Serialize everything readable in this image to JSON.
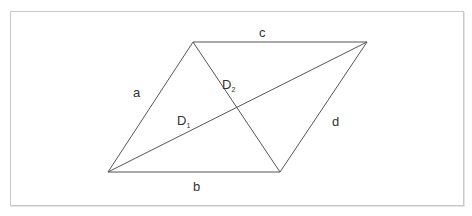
{
  "diagram": {
    "shape": "parallelogram",
    "vertices": {
      "bottom_left": [
        108,
        172
      ],
      "top_left": [
        193,
        42
      ],
      "top_right": [
        367,
        42
      ],
      "bottom_right": [
        280,
        172
      ]
    },
    "labels": {
      "a": "a",
      "b": "b",
      "c": "c",
      "d": "d",
      "D1": "D",
      "D1_sub": "1",
      "D2": "D",
      "D2_sub": "2"
    },
    "colors": {
      "line": "#555555",
      "border": "#c8c8c8",
      "text": "#333333"
    }
  }
}
